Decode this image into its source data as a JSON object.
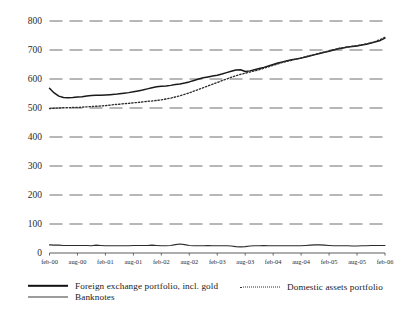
{
  "chart_data": {
    "type": "line",
    "title": "",
    "subtitle": "",
    "xlabel": "",
    "ylabel": "",
    "ylim": [
      0,
      800
    ],
    "yticks": [
      0,
      100,
      200,
      300,
      400,
      500,
      600,
      700,
      800
    ],
    "grid": "horizontal-dashed",
    "legend_position": "bottom",
    "xticks": [
      "feb-00",
      "aug-00",
      "feb-01",
      "aug-01",
      "feb-02",
      "aug-02",
      "feb-03",
      "aug-03",
      "feb-04",
      "aug-04",
      "feb-05",
      "aug-05",
      "feb-06"
    ],
    "x": [
      "feb-00",
      "mar-00",
      "apr-00",
      "may-00",
      "jun-00",
      "jul-00",
      "aug-00",
      "sep-00",
      "oct-00",
      "nov-00",
      "dec-00",
      "jan-01",
      "feb-01",
      "mar-01",
      "apr-01",
      "may-01",
      "jun-01",
      "jul-01",
      "aug-01",
      "sep-01",
      "oct-01",
      "nov-01",
      "dec-01",
      "jan-02",
      "feb-02",
      "mar-02",
      "apr-02",
      "may-02",
      "jun-02",
      "jul-02",
      "aug-02",
      "sep-02",
      "oct-02",
      "nov-02",
      "dec-02",
      "jan-03",
      "feb-03",
      "mar-03",
      "apr-03",
      "may-03",
      "jun-03",
      "jul-03",
      "aug-03",
      "sep-03",
      "oct-03",
      "nov-03",
      "dec-03",
      "jan-04",
      "feb-04",
      "mar-04",
      "apr-04",
      "may-04",
      "jun-04",
      "jul-04",
      "aug-04",
      "sep-04",
      "oct-04",
      "nov-04",
      "dec-04",
      "jan-05",
      "feb-05",
      "mar-05",
      "apr-05",
      "may-05",
      "jun-05",
      "jul-05",
      "aug-05",
      "sep-05",
      "oct-05",
      "nov-05",
      "dec-05",
      "jan-06",
      "feb-06"
    ],
    "series": [
      {
        "name": "Foreign exchange portfolio, incl. gold",
        "style": "solid-thick",
        "color": "#1a1a1a",
        "values": [
          568,
          552,
          541,
          536,
          535,
          536,
          538,
          539,
          541,
          543,
          544,
          544,
          545,
          546,
          547,
          549,
          551,
          553,
          556,
          559,
          562,
          566,
          570,
          573,
          575,
          576,
          578,
          581,
          583,
          586,
          590,
          595,
          600,
          604,
          607,
          610,
          613,
          617,
          622,
          627,
          631,
          632,
          626,
          628,
          632,
          636,
          640,
          645,
          650,
          655,
          659,
          663,
          666,
          669,
          672,
          676,
          680,
          684,
          688,
          692,
          696,
          700,
          704,
          707,
          710,
          712,
          714,
          717,
          720,
          724,
          728,
          733,
          741
        ]
      },
      {
        "name": "Domestic assets portfolio",
        "style": "dotted",
        "color": "#2f2f2f",
        "values": [
          498,
          499,
          500,
          501,
          501,
          502,
          502,
          503,
          504,
          505,
          506,
          507,
          508,
          510,
          512,
          513,
          515,
          516,
          518,
          519,
          521,
          523,
          524,
          526,
          528,
          531,
          534,
          538,
          542,
          547,
          552,
          558,
          564,
          570,
          576,
          582,
          588,
          594,
          600,
          606,
          611,
          616,
          620,
          624,
          628,
          632,
          637,
          642,
          647,
          652,
          657,
          661,
          665,
          669,
          673,
          677,
          681,
          685,
          689,
          693,
          697,
          701,
          705,
          708,
          711,
          713,
          715,
          718,
          721,
          725,
          730,
          736,
          744
        ]
      },
      {
        "name": "Banknotes",
        "style": "solid-thin",
        "color": "#2b2b2b",
        "values": [
          28,
          27,
          27,
          26,
          26,
          26,
          26,
          26,
          26,
          25,
          27,
          26,
          25,
          25,
          25,
          25,
          25,
          25,
          26,
          26,
          26,
          26,
          27,
          26,
          25,
          25,
          26,
          29,
          31,
          29,
          26,
          25,
          25,
          25,
          26,
          25,
          25,
          25,
          25,
          24,
          22,
          21,
          22,
          24,
          25,
          25,
          26,
          25,
          25,
          25,
          25,
          25,
          25,
          25,
          25,
          26,
          27,
          28,
          28,
          27,
          26,
          25,
          25,
          25,
          25,
          24,
          24,
          25,
          25,
          26,
          26,
          26,
          26
        ]
      }
    ]
  },
  "legend": {
    "items": [
      {
        "label": "Foreign exchange portfolio, incl. gold",
        "key": "solid-thick-line-icon"
      },
      {
        "label": "Domestic assets portfolio",
        "key": "dotted-line-icon"
      },
      {
        "label": "Banknotes",
        "key": "solid-thin-line-icon"
      }
    ]
  }
}
